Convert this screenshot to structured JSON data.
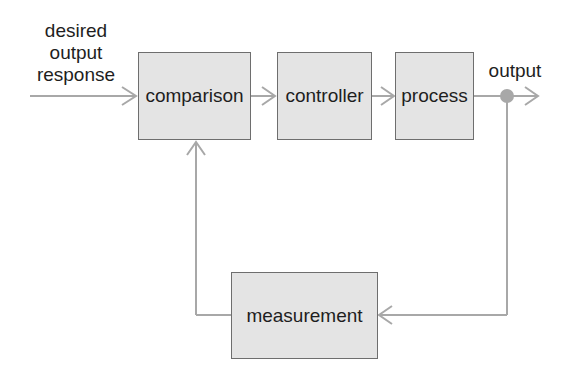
{
  "diagram": {
    "input_label": [
      "desired",
      "output",
      "response"
    ],
    "output_label": "output",
    "blocks": {
      "comparison": "comparison",
      "controller": "controller",
      "process": "process",
      "measurement": "measurement"
    },
    "colors": {
      "block_fill": "#e4e4e4",
      "block_border": "#6e6e6e",
      "line": "#a8a8a8",
      "junction": "#a8a8a8"
    }
  }
}
